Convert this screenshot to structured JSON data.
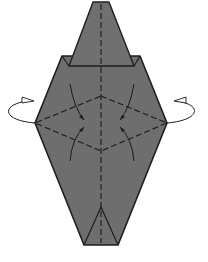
{
  "diagram": {
    "type": "origami-step",
    "colors": {
      "paper": "#6e6e6e",
      "edge": "#1e1e1e",
      "valley_fold": "#1a1a1a",
      "arrow": "#1a1a1a",
      "background": "#ffffff"
    },
    "elements": [
      {
        "name": "top-point-flap",
        "kind": "paper"
      },
      {
        "name": "body-hexagon",
        "kind": "paper"
      },
      {
        "name": "center-valley-fold",
        "kind": "valley-fold-line"
      },
      {
        "name": "diamond-valley-folds",
        "kind": "valley-fold-lines"
      },
      {
        "name": "squash-arrows",
        "kind": "fold-arrows",
        "count": 4
      },
      {
        "name": "turn-over-arrow-left",
        "kind": "rotate-arrow"
      },
      {
        "name": "turn-over-arrow-right",
        "kind": "rotate-arrow"
      },
      {
        "name": "bottom-inner-triangle",
        "kind": "edge-lines"
      }
    ]
  }
}
